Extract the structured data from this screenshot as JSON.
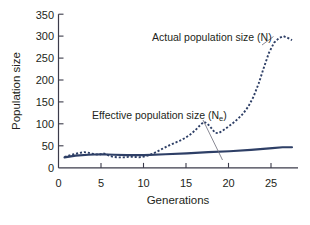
{
  "chart_data": {
    "type": "line",
    "title": "",
    "xlabel": "Generations",
    "ylabel": "Population size",
    "xlim": [
      0,
      28
    ],
    "ylim": [
      0,
      350
    ],
    "xticks": [
      0,
      5,
      10,
      15,
      20,
      25
    ],
    "yticks": [
      0,
      50,
      100,
      150,
      200,
      250,
      300,
      350
    ],
    "grid": false,
    "legend": "annotations",
    "annotations": [
      {
        "id": "actual",
        "text": "Actual population size (N)",
        "text_main": "Actual population size (N)",
        "subscript": "",
        "points_to_series": "Actual population size (N)"
      },
      {
        "id": "effective",
        "text": "Effective population size (Ne)",
        "text_main": "Effective population size (N",
        "subscript": "e",
        "text_tail": ")",
        "points_to_series": "Effective population size (Ne)"
      }
    ],
    "series": [
      {
        "name": "Actual population size (N)",
        "style": "dashed",
        "color": "#2e3f66",
        "x": [
          0.7,
          1.2,
          1.8,
          2.4,
          3.0,
          3.4,
          3.8,
          4.3,
          4.8,
          5.2,
          5.5,
          5.9,
          6.4,
          7.0,
          7.6,
          8.2,
          8.8,
          9.4,
          10.0,
          10.6,
          11.2,
          11.8,
          12.4,
          13.0,
          13.6,
          14.2,
          14.8,
          15.4,
          16.0,
          16.5,
          17.0,
          17.4,
          17.9,
          18.3,
          18.7,
          19.2,
          19.8,
          20.4,
          21.0,
          21.6,
          22.2,
          22.8,
          23.4,
          24.0,
          24.6,
          25.2,
          25.8,
          26.3,
          26.8,
          27.3
        ],
        "y": [
          25,
          28,
          31,
          34,
          36,
          35,
          33,
          31,
          30,
          33,
          32,
          28,
          25,
          24,
          24,
          25,
          25,
          24,
          26,
          29,
          34,
          40,
          46,
          52,
          57,
          62,
          68,
          76,
          86,
          96,
          105,
          101,
          90,
          80,
          79,
          85,
          93,
          102,
          112,
          124,
          140,
          162,
          192,
          228,
          262,
          285,
          296,
          300,
          296,
          291
        ]
      },
      {
        "name": "Effective population size (Ne)",
        "style": "solid",
        "color": "#2e3f66",
        "x": [
          0.7,
          2.0,
          3.5,
          5.0,
          6.5,
          8.0,
          10.0,
          12.5,
          15.0,
          17.5,
          20.0,
          22.5,
          25.0,
          26.2,
          27.3
        ],
        "y": [
          24,
          28,
          30,
          31,
          30,
          29,
          29,
          31,
          33,
          36,
          38,
          41,
          45,
          47,
          47
        ]
      }
    ]
  },
  "colors": {
    "series": "#2e3f66",
    "axis": "#3b3b4a",
    "text": "#231f20",
    "leader": "#6b6b78",
    "background": "#ffffff"
  },
  "axis_labels": {
    "x_title": "Generations",
    "y_title": "Population size",
    "x_ticks": [
      "0",
      "5",
      "10",
      "15",
      "20",
      "25"
    ],
    "y_ticks": [
      "0",
      "50",
      "100",
      "150",
      "200",
      "250",
      "300",
      "350"
    ]
  },
  "annotation_text": {
    "actual": "Actual population size (N)",
    "effective_main": "Effective population size (N",
    "effective_sub": "e",
    "effective_tail": ")"
  }
}
